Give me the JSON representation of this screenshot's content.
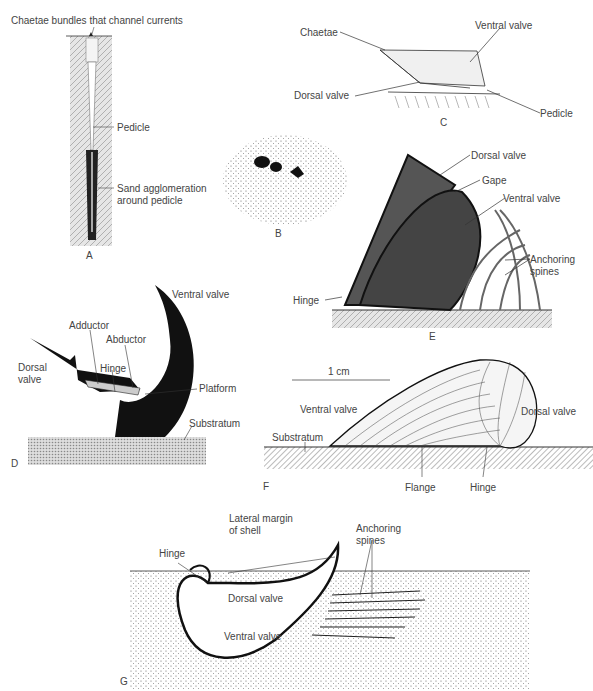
{
  "panels": {
    "A": {
      "letter": "A",
      "labels": {
        "chaetae": "Chaetae bundles that channel currents",
        "pedicle": "Pedicle",
        "sand1": "Sand agglomeration",
        "sand2": "around pedicle"
      }
    },
    "B": {
      "letter": "B"
    },
    "C": {
      "letter": "C",
      "labels": {
        "chaetae": "Chaetae",
        "ventral": "Ventral valve",
        "dorsal": "Dorsal valve",
        "pedicle": "Pedicle"
      }
    },
    "D": {
      "letter": "D",
      "labels": {
        "ventral": "Ventral valve",
        "adductor": "Adductor",
        "abductor": "Abductor",
        "dorsal1": "Dorsal",
        "dorsal2": "valve",
        "hinge": "Hinge",
        "platform": "Platform",
        "substratum": "Substratum"
      }
    },
    "E": {
      "letter": "E",
      "labels": {
        "dorsal": "Dorsal valve",
        "gape": "Gape",
        "ventral": "Ventral valve",
        "anchoring1": "Anchoring",
        "anchoring2": "spines",
        "hinge": "Hinge"
      }
    },
    "F": {
      "letter": "F",
      "labels": {
        "scale": "1 cm",
        "ventral": "Ventral valve",
        "dorsal": "Dorsal valve",
        "substratum": "Substratum",
        "flange": "Flange",
        "hinge": "Hinge"
      }
    },
    "G": {
      "letter": "G",
      "labels": {
        "lateral1": "Lateral margin",
        "lateral2": "of shell",
        "anchoring1": "Anchoring",
        "anchoring2": "spines",
        "hinge": "Hinge",
        "dorsal": "Dorsal valve",
        "ventral": "Ventral valve"
      }
    }
  }
}
